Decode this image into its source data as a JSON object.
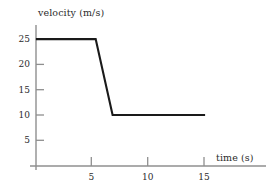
{
  "chart_data": {
    "type": "line",
    "title": "",
    "xlabel": "time (s)",
    "ylabel": "velocity (m/s)",
    "xlim": [
      0,
      20.3
    ],
    "ylim": [
      0,
      27.8
    ],
    "grid": false,
    "legend": "none",
    "xticks": [
      5,
      10,
      15
    ],
    "xtick_labels": [
      "5",
      "10",
      "15"
    ],
    "yticks": [
      5,
      10,
      15,
      20,
      25
    ],
    "ytick_labels": [
      "5",
      "10",
      "15",
      "20",
      "25"
    ],
    "series": [
      {
        "name": "velocity",
        "color": "#1a1a1a",
        "x": [
          0,
          5.3,
          6.8,
          15
        ],
        "y": [
          25,
          25,
          10,
          10
        ]
      }
    ],
    "annotations": [],
    "axis_color": "#8a8a8a",
    "line_color": "#1a1a1a",
    "background": "#ffffff"
  },
  "figure": {
    "x_axis_name": "time-axis",
    "y_axis_name": "velocity-axis",
    "plot_name": "velocity-time-line"
  }
}
